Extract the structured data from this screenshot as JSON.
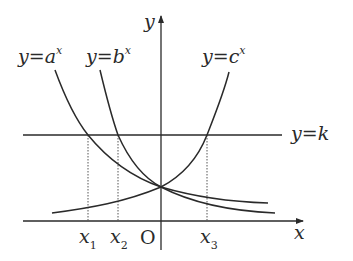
{
  "diagram": {
    "type": "exponential-function-graphs",
    "axes": {
      "x_label": "x",
      "y_label": "y",
      "origin_label": "O"
    },
    "curves": [
      {
        "id": "a",
        "label_lhs": "y=",
        "label_base": "a",
        "label_exp": "x",
        "behavior": "decreasing"
      },
      {
        "id": "b",
        "label_lhs": "y=",
        "label_base": "b",
        "label_exp": "x",
        "behavior": "decreasing"
      },
      {
        "id": "c",
        "label_lhs": "y=",
        "label_base": "c",
        "label_exp": "x",
        "behavior": "increasing"
      }
    ],
    "horizontal_line": {
      "label": "y=k"
    },
    "intersections": [
      {
        "label_base": "x",
        "label_sub": "1",
        "curve": "a"
      },
      {
        "label_base": "x",
        "label_sub": "2",
        "curve": "b"
      },
      {
        "label_base": "x",
        "label_sub": "3",
        "curve": "c"
      }
    ],
    "colors": {
      "stroke": "#2a2a2a",
      "background": "#ffffff"
    }
  }
}
